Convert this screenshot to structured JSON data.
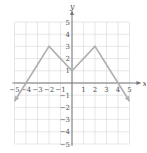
{
  "chart_data": {
    "type": "line",
    "title": "",
    "xlabel": "x",
    "ylabel": "y",
    "xlim": [
      -5,
      5
    ],
    "ylim": [
      -5,
      5
    ],
    "grid": true,
    "xticks": [
      -5,
      -4,
      -3,
      -2,
      -1,
      1,
      2,
      3,
      4,
      5
    ],
    "yticks": [
      -5,
      -4,
      -3,
      -2,
      -1,
      1,
      2,
      3,
      4,
      5
    ],
    "xtick_labels": [
      "−5",
      "−4",
      "−3",
      "−2",
      "−1",
      "1",
      "2",
      "3",
      "4",
      "5"
    ],
    "ytick_labels": [
      "−5",
      "−4",
      "−3",
      "−2",
      "−1",
      "1",
      "2",
      "3",
      "4",
      "5"
    ],
    "series": [
      {
        "name": "f(x)",
        "x": [
          -5,
          -4,
          -2,
          0,
          2,
          4,
          5
        ],
        "y": [
          -1.5,
          0,
          3,
          1,
          3,
          0,
          -1.5
        ],
        "arrows_at_ends": true
      }
    ],
    "colors": {
      "curve": "#b0b0b0",
      "axis": "#777777",
      "grid": "#dddddd"
    }
  },
  "labels": {
    "x_axis": "x",
    "y_axis": "y"
  }
}
